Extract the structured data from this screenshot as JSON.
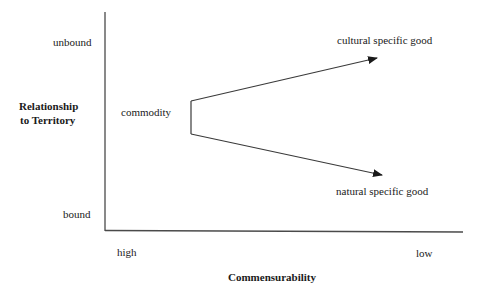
{
  "diagram": {
    "y_axis": {
      "title_line1": "Relationship",
      "title_line2": "to Territory",
      "top_label": "unbound",
      "bottom_label": "bound"
    },
    "x_axis": {
      "title": "Commensurability",
      "left_label": "high",
      "right_label": "low"
    },
    "nodes": {
      "origin": "commodity",
      "upper_target": "cultural specific good",
      "lower_target": "natural specific good"
    },
    "edges": [
      {
        "from": "commodity",
        "to": "cultural specific good",
        "direction": "up-right"
      },
      {
        "from": "commodity",
        "to": "natural specific good",
        "direction": "down-right"
      }
    ],
    "colors": {
      "line": "#3a3a3a",
      "text": "#1a1a1a",
      "background": "#ffffff"
    }
  }
}
